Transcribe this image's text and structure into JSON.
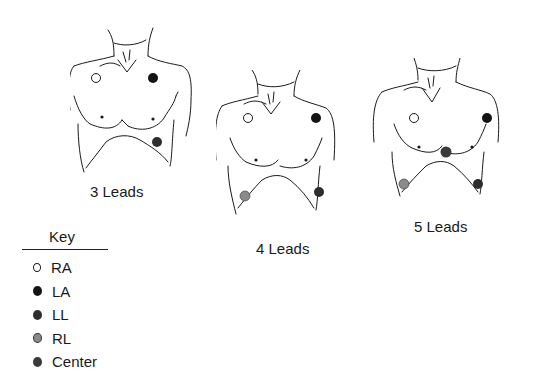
{
  "colors": {
    "RA": "#ffffff",
    "LA": "#141414",
    "LL": "#2e2e2e",
    "RL": "#8a8a8a",
    "Center": "#3a3a3a",
    "outline": "#1a1a1a"
  },
  "diagrams": [
    {
      "id": "3-leads",
      "caption": "3 Leads",
      "leads": [
        "RA",
        "LA",
        "LL"
      ]
    },
    {
      "id": "4-leads",
      "caption": "4 Leads",
      "leads": [
        "RA",
        "LA",
        "RL",
        "LL"
      ]
    },
    {
      "id": "5-leads",
      "caption": "5 Leads",
      "leads": [
        "RA",
        "LA",
        "Center",
        "RL",
        "LL"
      ]
    }
  ],
  "key": {
    "title": "Key",
    "items": [
      {
        "label": "RA"
      },
      {
        "label": "LA"
      },
      {
        "label": "LL"
      },
      {
        "label": "RL"
      },
      {
        "label": "Center"
      }
    ]
  }
}
